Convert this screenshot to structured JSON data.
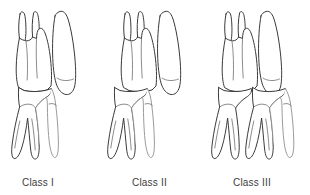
{
  "figure": {
    "background_color": "#ffffff",
    "line_color": "#3a3a3a",
    "panel_count": 3
  },
  "panels": [
    {
      "id": "class-1",
      "label": "Class I",
      "label_x": 22,
      "label_y": 186,
      "description": "Normal molar relationship: mesiobuccal cusp of upper first molar occludes with the buccal groove of the lower first molar",
      "upper_teeth": [
        {
          "name": "upper-molar",
          "roots": 3,
          "cusps": 2
        },
        {
          "name": "upper-premolar",
          "roots": 1,
          "cusps": 1
        }
      ],
      "lower_teeth": [
        {
          "name": "lower-molar",
          "roots": 2,
          "cusps": 2
        }
      ]
    },
    {
      "id": "class-2",
      "label": "Class II",
      "label_x": 132,
      "label_y": 186,
      "description": "Distocclusion: lower molar positioned distally relative to the upper molar",
      "upper_teeth": [
        {
          "name": "upper-molar",
          "roots": 3,
          "cusps": 2
        },
        {
          "name": "upper-premolar",
          "roots": 1,
          "cusps": 1
        }
      ],
      "lower_teeth": [
        {
          "name": "lower-molar",
          "roots": 2,
          "cusps": 2
        }
      ]
    },
    {
      "id": "class-3",
      "label": "Class III",
      "label_x": 233,
      "label_y": 186,
      "description": "Mesiocclusion: lower molar positioned mesially relative to the upper molar",
      "upper_teeth": [
        {
          "name": "upper-molar",
          "roots": 3,
          "cusps": 2
        },
        {
          "name": "upper-premolar",
          "roots": 1,
          "cusps": 1
        }
      ],
      "lower_teeth": [
        {
          "name": "lower-molar",
          "roots": 2,
          "cusps": 2
        },
        {
          "name": "lower-second-molar",
          "roots": 2,
          "cusps": 2
        },
        {
          "name": "lower-premolar",
          "roots": 1,
          "cusps": 1
        }
      ]
    }
  ]
}
